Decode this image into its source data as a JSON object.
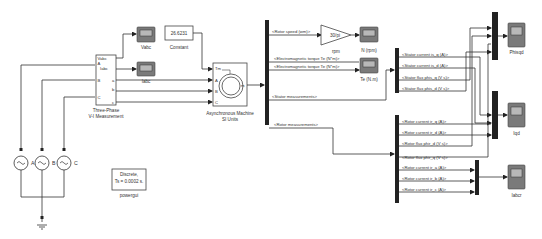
{
  "diagram": {
    "blocks": {
      "vi_measurement": {
        "title_line1": "Three-Phase",
        "title_line2": "V-I Measurement",
        "ports_left": [
          "A",
          "B",
          "C"
        ],
        "ports_right": [
          "Vabc",
          "Iabc",
          "a",
          "b",
          "c"
        ]
      },
      "constant": {
        "value": "26.6231",
        "label": "Constant"
      },
      "machine": {
        "label_line1": "Asynchronous Machine",
        "label_line2": "SI Units",
        "ports_in": [
          "Tm",
          "A",
          "B",
          "C"
        ],
        "port_out": "m"
      },
      "sources": [
        {
          "label": "A"
        },
        {
          "label": "B"
        },
        {
          "label": "C"
        }
      ],
      "powergui": {
        "line1": "Discrete,",
        "line2": "Ts = 0.0002 s.",
        "label": "powergui"
      },
      "gain": {
        "value": "30/pi",
        "label": "rpm"
      }
    },
    "scopes": {
      "vabc": "Vabc",
      "iabc": "Iabc",
      "n_rpm": "N (rpm)",
      "te": "Te (N.m)",
      "phisqd": "Phisqd",
      "iqd": "Iqd",
      "iabcr": "Iabcr"
    },
    "signals": {
      "rotor_speed": "<Rotor speed (wm)>",
      "te1": "<Electromagnetic torque Te (N*m)>",
      "te2": "<Electromagnetic torque Te (N*m)>",
      "stator_meas": "<Stator measurements>",
      "rotor_meas": "<Rotor measurements>",
      "stator": [
        "<Stator current is_q (A)>",
        "<Stator current is_d (A)>",
        "<Stator flux phis_q (V s)>",
        "<Stator flux phis_d (V s)>"
      ],
      "rotor": [
        "<Rotor current ir_q (A)>",
        "<Rotor current ir_d (A)>",
        "<Rotor flux phir_d (V s)>",
        "<Rotor flux phir_q (V s)>",
        "<Rotor current ir_a (A)>",
        "<Rotor current ir_b (A)>",
        "<Rotor current ir_c (A)>"
      ]
    }
  }
}
